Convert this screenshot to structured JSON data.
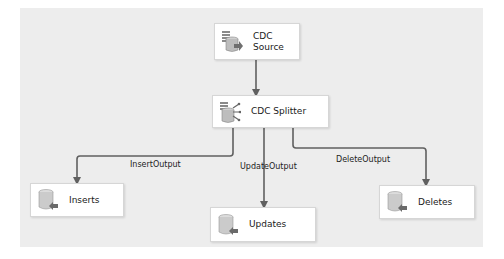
{
  "diagram": {
    "nodes": [
      {
        "id": "cdc-source",
        "label_line1": "CDC",
        "label_line2": "Source",
        "icon": "cdc-source-icon"
      },
      {
        "id": "cdc-splitter",
        "label": "CDC Splitter",
        "icon": "cdc-splitter-icon"
      },
      {
        "id": "inserts",
        "label": "Inserts",
        "icon": "database-destination-icon"
      },
      {
        "id": "updates",
        "label": "Updates",
        "icon": "database-destination-icon"
      },
      {
        "id": "deletes",
        "label": "Deletes",
        "icon": "database-destination-icon"
      }
    ],
    "paths": [
      {
        "from": "cdc-source",
        "to": "cdc-splitter",
        "label": ""
      },
      {
        "from": "cdc-splitter",
        "to": "inserts",
        "label": "InsertOutput"
      },
      {
        "from": "cdc-splitter",
        "to": "updates",
        "label": "UpdateOutput"
      },
      {
        "from": "cdc-splitter",
        "to": "deletes",
        "label": "DeleteOutput"
      }
    ],
    "colors": {
      "canvas": "#ededed",
      "node_fill": "#ffffff",
      "wire": "#606060"
    }
  }
}
